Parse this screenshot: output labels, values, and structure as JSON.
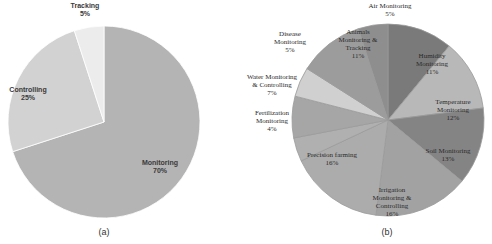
{
  "chart_data": [
    {
      "type": "pie",
      "caption": "(a)",
      "start": "top",
      "direction": "clockwise",
      "slices": [
        {
          "label": "Monitoring",
          "value": 70,
          "value_label": "70%",
          "color": "#b4b4b4"
        },
        {
          "label": "Controlling",
          "value": 25,
          "value_label": "25%",
          "color": "#d2d2d2"
        },
        {
          "label": "Tracking",
          "value": 5,
          "value_label": "5%",
          "color": "#ececec"
        }
      ]
    },
    {
      "type": "pie",
      "caption": "(b)",
      "start": "top",
      "direction": "clockwise",
      "slices": [
        {
          "label": "Humidity Monitoring",
          "lines": [
            "Humidity",
            "Monitoring"
          ],
          "value": 11,
          "value_label": "11%",
          "color": "#7a7a7a"
        },
        {
          "label": "Temperature Monitoring",
          "lines": [
            "Temperature",
            "Monitoring"
          ],
          "value": 12,
          "value_label": "12%",
          "color": "#b8b8b8"
        },
        {
          "label": "Soil Monitoring",
          "lines": [
            "Soil Monitoring"
          ],
          "value": 13,
          "value_label": "13%",
          "color": "#848484"
        },
        {
          "label": "Irrigation Monitoring & Controlling",
          "lines": [
            "Irrigation",
            "Monitoring &",
            "Controlling"
          ],
          "value": 16,
          "value_label": "16%",
          "color": "#a2a2a2"
        },
        {
          "label": "Precision farming",
          "lines": [
            "Precision farming"
          ],
          "value": 16,
          "value_label": "16%",
          "color": "#acacac"
        },
        {
          "label": "Fertilization Monitoring",
          "lines": [
            "Fertilization",
            "Monitoring"
          ],
          "value": 4,
          "value_label": "4%",
          "color": "#b0b0b0"
        },
        {
          "label": "Water Monitoring & Controlling",
          "lines": [
            "Water Monitoring",
            "& Controlling"
          ],
          "value": 7,
          "value_label": "7%",
          "color": "#a6a6a6"
        },
        {
          "label": "Disease Monitoring",
          "lines": [
            "Disease",
            "Monitoring"
          ],
          "value": 5,
          "value_label": "5%",
          "color": "#d0d0d0"
        },
        {
          "label": "Animals Monitoring & Tracking",
          "lines": [
            "Animals",
            "Monitoring &",
            "Tracking"
          ],
          "value": 11,
          "value_label": "11%",
          "color": "#9c9c9c"
        },
        {
          "label": "Air Monitoring",
          "lines": [
            "Air Monitoring"
          ],
          "value": 5,
          "value_label": "5%",
          "color": "#8e8e8e"
        }
      ]
    }
  ]
}
